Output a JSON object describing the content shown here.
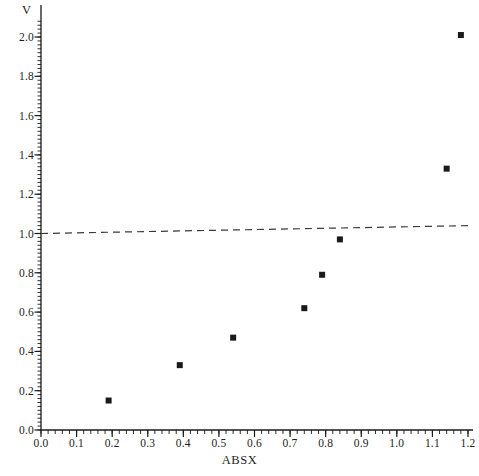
{
  "chart_data": {
    "type": "scatter",
    "title": "",
    "xlabel": "ABSX",
    "ylabel": "V",
    "xlim": [
      0.0,
      1.2
    ],
    "ylim": [
      0.0,
      2.0
    ],
    "grid": false,
    "legend": "none",
    "xticks": [
      0.0,
      0.1,
      0.2,
      0.3,
      0.4,
      0.5,
      0.6,
      0.7,
      0.8,
      0.9,
      1.0,
      1.1,
      1.2
    ],
    "xtick_labels": [
      "0.0",
      "0.1",
      "0.2",
      "0.3",
      "0.4",
      "0.5",
      "0.6",
      "0.7",
      "0.8",
      "0.9",
      "1.0",
      "1.1",
      "1.2"
    ],
    "yticks": [
      0.0,
      0.2,
      0.4,
      0.6,
      0.8,
      1.0,
      1.2,
      1.4,
      1.6,
      1.8,
      2.0
    ],
    "ytick_labels": [
      "0.0",
      "0.2",
      "0.4",
      "0.6",
      "0.8",
      "1.0",
      "1.2",
      "1.4",
      "1.6",
      "1.8",
      "2.0"
    ],
    "minor_tick_interval": 0.02,
    "series": [
      {
        "name": "data",
        "marker": "square",
        "marker_color": "#1a1a1a",
        "marker_size": 6,
        "points": [
          {
            "x": 0.19,
            "y": 0.15
          },
          {
            "x": 0.39,
            "y": 0.33
          },
          {
            "x": 0.54,
            "y": 0.47
          },
          {
            "x": 0.74,
            "y": 0.62
          },
          {
            "x": 0.79,
            "y": 0.79
          },
          {
            "x": 0.84,
            "y": 0.97
          },
          {
            "x": 1.14,
            "y": 1.33
          },
          {
            "x": 1.18,
            "y": 2.01
          }
        ]
      }
    ],
    "reference_line": {
      "name": "reference-dashed-line",
      "style": "dashed",
      "color": "#3a3a3a",
      "x_start": 0.0,
      "y_start": 1.0,
      "x_end": 1.2,
      "y_end": 1.04
    },
    "axis_color": "#1a1a1a"
  }
}
